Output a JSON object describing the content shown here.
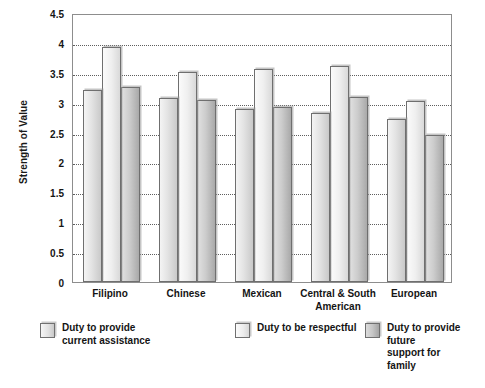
{
  "chart_data": {
    "type": "bar",
    "title": "",
    "xlabel": "",
    "ylabel": "Strength of Value",
    "ylim": [
      0,
      4.5
    ],
    "ytick_labels": [
      "4.5",
      "4",
      "3.5",
      "3",
      "2.5",
      "2",
      "1.5",
      "1",
      "0.5",
      "0"
    ],
    "ytick_values": [
      4.5,
      4,
      3.5,
      3,
      2.5,
      2,
      1.5,
      1,
      0.5,
      0
    ],
    "grid": true,
    "grid_axis": "y",
    "legend_position": "bottom",
    "categories": [
      "Filipino",
      "Chinese",
      "Mexican",
      "Central & South American",
      "European"
    ],
    "series": [
      {
        "name": "Duty to provide current assistance",
        "legend_label": "Duty to provide\ncurrent assistance",
        "color": "#e2e2e2",
        "values": [
          3.22,
          3.07,
          2.89,
          2.82,
          2.72
        ]
      },
      {
        "name": "Duty to be respectful",
        "legend_label": "Duty to be respectful",
        "color": "#efefef",
        "values": [
          3.93,
          3.52,
          3.57,
          3.62,
          3.03
        ]
      },
      {
        "name": "Duty to provide future support for family",
        "legend_label": "Duty to provide future\nsupport for family",
        "color": "#bfbfbf",
        "values": [
          3.27,
          3.05,
          2.93,
          3.1,
          2.46
        ]
      }
    ]
  },
  "axis": {
    "y_title": "Strength of Value"
  },
  "category_labels": [
    "Filipino",
    "Chinese",
    "Mexican",
    "Central & South\nAmerican",
    "European"
  ],
  "legend": {
    "items": [
      {
        "label": "Duty to provide\ncurrent assistance",
        "swatch": "series-1-swatch"
      },
      {
        "label": "Duty to be respectful",
        "swatch": "series-2-swatch"
      },
      {
        "label": "Duty to provide future\nsupport for family",
        "swatch": "series-3-swatch"
      }
    ]
  }
}
